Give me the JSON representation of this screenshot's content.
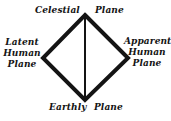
{
  "diagram": {
    "shape": "diamond",
    "background_color": "#ffffff",
    "stroke_color": "#141414",
    "edge_stroke_width": 4,
    "axis_stroke_width": 2,
    "vertices": {
      "top": {
        "x": 85,
        "y": 15
      },
      "left": {
        "x": 43,
        "y": 58
      },
      "bottom": {
        "x": 85,
        "y": 100
      },
      "right": {
        "x": 128,
        "y": 58
      }
    },
    "center_axis": {
      "from": "top",
      "to": "bottom"
    },
    "labels": {
      "top": {
        "full": "Celestial Plane",
        "word": "Celestial",
        "plane": "Plane"
      },
      "left": {
        "full": "Latent Human Plane",
        "lines": [
          "Latent",
          "Human",
          "Plane"
        ]
      },
      "right": {
        "full": "Apparent Human Plane",
        "lines": [
          "Apparent",
          "Human",
          "Plane"
        ]
      },
      "bottom": {
        "full": "Earthly Plane",
        "word": "Earthly",
        "plane": "Plane"
      }
    }
  }
}
